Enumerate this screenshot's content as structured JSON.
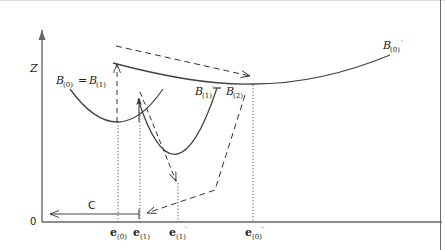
{
  "diagram": {
    "axes": {
      "y_label": "Z",
      "origin_label": "0"
    },
    "curves": [
      {
        "id": "B0_eq_B1",
        "label_main": "B",
        "label_sub": "(0)",
        "label_eq": "=",
        "label_main2": "B",
        "label_sub2": "(1)"
      },
      {
        "id": "B1p_B2",
        "label_main": "B",
        "label_sub": "(1)",
        "label_prime": "′",
        "label_main2": "B",
        "label_sub2": "(2)"
      },
      {
        "id": "B0p",
        "label_main": "B",
        "label_sub": "(0)",
        "label_prime": "′"
      }
    ],
    "x_ticks": [
      {
        "main": "e",
        "sub": "(0)",
        "prime": ""
      },
      {
        "main": "e",
        "sub": "(1)",
        "prime": ""
      },
      {
        "main": "e",
        "sub": "(1)",
        "prime": "′"
      },
      {
        "main": "e",
        "sub": "(0)",
        "prime": "′"
      }
    ],
    "arrow_label": "C"
  }
}
